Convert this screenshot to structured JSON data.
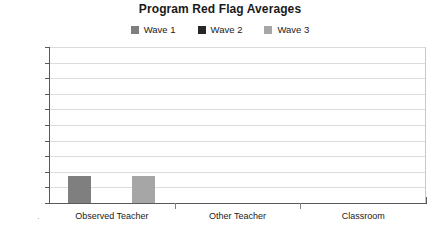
{
  "chart_data": {
    "type": "bar",
    "title": "Program Red Flag Averages",
    "subtitle": "",
    "xlabel": "",
    "ylabel": "",
    "categories": [
      "Observed Teacher",
      "Other Teacher",
      "Classroom"
    ],
    "series": [
      {
        "name": "Wave 1",
        "color": "#7f7f7f",
        "values": [
          17,
          0,
          0
        ]
      },
      {
        "name": "Wave 2",
        "color": "#262626",
        "values": [
          0,
          0,
          0
        ]
      },
      {
        "name": "Wave 3",
        "color": "#a6a6a6",
        "values": [
          17,
          0,
          0
        ]
      }
    ],
    "ylim": [
      0,
      100
    ],
    "y_ticks": [
      "0%",
      "10%",
      "20%",
      "30%",
      "40%",
      "50%",
      "60%",
      "70%",
      "80%",
      "90%",
      "100%"
    ],
    "y_tick_values": [
      0,
      10,
      20,
      30,
      40,
      50,
      60,
      70,
      80,
      90,
      100
    ],
    "value_suffix": "%",
    "grid": true,
    "grid_color": "#dcdcdc",
    "legend_position": "top",
    "axis_color": "#595959",
    "background": "#ffffff"
  },
  "legend": {
    "items": [
      {
        "label": "Wave 1",
        "color": "#7f7f7f",
        "swatch": "legend-swatch-wave-1"
      },
      {
        "label": "Wave 2",
        "color": "#262626",
        "swatch": "legend-swatch-wave-2"
      },
      {
        "label": "Wave 3",
        "color": "#a6a6a6",
        "swatch": "legend-swatch-wave-3"
      }
    ]
  },
  "axis": {
    "origin_marker": "·"
  }
}
